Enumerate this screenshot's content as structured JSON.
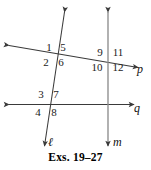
{
  "figure": {
    "caption": "Exs. 19–27",
    "stroke_color": "#3a3a3a",
    "text_color": "#1a1a1a",
    "background": "#ffffff",
    "lines": [
      {
        "id": "line-l",
        "label": "ℓ",
        "orientation": "slanted-vertical",
        "arrows": "both"
      },
      {
        "id": "line-m",
        "label": "m",
        "orientation": "vertical",
        "arrows": "both"
      },
      {
        "id": "line-p",
        "label": "p",
        "orientation": "slanted-horizontal",
        "arrows": "both"
      },
      {
        "id": "line-q",
        "label": "q",
        "orientation": "horizontal",
        "arrows": "both"
      }
    ],
    "line_labels": {
      "l": "ℓ",
      "m": "m",
      "p": "p",
      "q": "q"
    },
    "intersections": [
      {
        "id": "l-p",
        "lines": [
          "ℓ",
          "p"
        ],
        "angles": {
          "upper_left": "1",
          "upper_right": "5",
          "lower_left": "2",
          "lower_right": "6"
        }
      },
      {
        "id": "m-p",
        "lines": [
          "m",
          "p"
        ],
        "angles": {
          "upper_left": "9",
          "upper_right": "11",
          "lower_left": "10",
          "lower_right": "12"
        }
      },
      {
        "id": "l-q",
        "lines": [
          "ℓ",
          "q"
        ],
        "angles": {
          "upper_left": "3",
          "upper_right": "7",
          "lower_left": "4",
          "lower_right": "8"
        }
      },
      {
        "id": "m-q",
        "lines": [
          "m",
          "q"
        ],
        "angles": {}
      }
    ],
    "angle_labels": {
      "a1": "1",
      "a2": "2",
      "a3": "3",
      "a4": "4",
      "a5": "5",
      "a6": "6",
      "a7": "7",
      "a8": "8",
      "a9": "9",
      "a10": "10",
      "a11": "11",
      "a12": "12"
    }
  }
}
